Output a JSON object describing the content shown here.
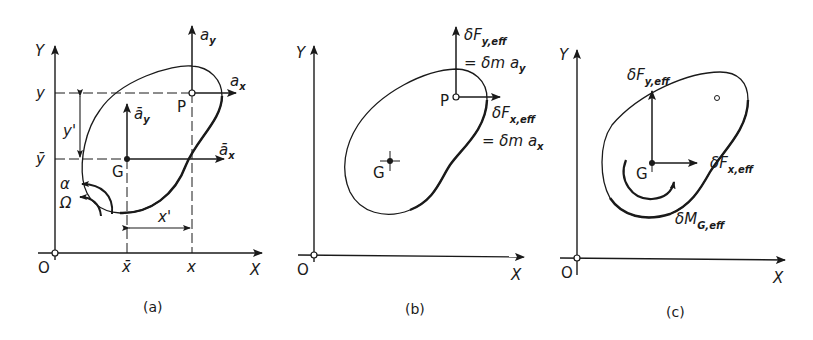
{
  "figure": {
    "panels": [
      {
        "id": "a",
        "caption": "(a)",
        "axes": {
          "x": "X",
          "y": "Y",
          "origin": "O"
        },
        "points": {
          "P": "P",
          "G": "G"
        },
        "coord_labels": {
          "y": "y",
          "ybar": "ȳ",
          "x": "x",
          "xbar": "x̄"
        },
        "dims": {
          "yprime": "y'",
          "xprime": "x'"
        },
        "vectors": {
          "ay": "a",
          "ay_sub": "y",
          "ax": "a",
          "ax_sub": "x",
          "aybar": "ā",
          "aybar_sub": "y",
          "axbar": "ā",
          "axbar_sub": "x"
        },
        "angular": {
          "alpha": "α",
          "omega": "Ω"
        }
      },
      {
        "id": "b",
        "caption": "(b)",
        "axes": {
          "x": "X",
          "y": "Y",
          "origin": "O"
        },
        "points": {
          "P": "P",
          "G": "G"
        },
        "forces": {
          "fy_main": "δF",
          "fy_sub": "y,eff",
          "fy_eq": "= δm a",
          "fy_eq_sub": "y",
          "fx_main": "δF",
          "fx_sub": "x,eff",
          "fx_eq": "= δm a",
          "fx_eq_sub": "x"
        }
      },
      {
        "id": "c",
        "caption": "(c)",
        "axes": {
          "x": "X",
          "y": "Y",
          "origin": "O"
        },
        "points": {
          "G": "G"
        },
        "forces": {
          "fy_main": "δF",
          "fy_sub": "y,eff",
          "fx_main": "δF",
          "fx_sub": "x,eff",
          "m_main": "δM",
          "m_sub": "G,eff"
        }
      }
    ],
    "colors": {
      "ink": "#1a1a1a",
      "background": "#ffffff"
    }
  }
}
